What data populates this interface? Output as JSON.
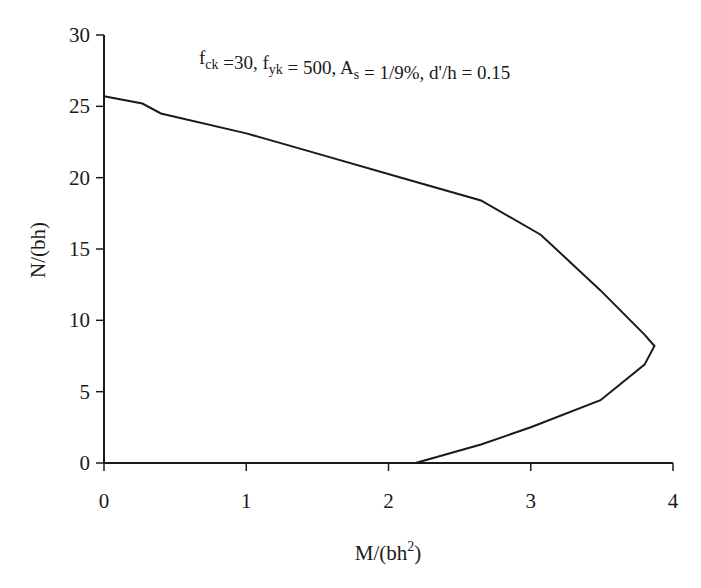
{
  "chart_data": {
    "type": "line",
    "title": "",
    "annotation": {
      "parts": [
        {
          "text": "f",
          "sub": "ck"
        },
        {
          "text": " =30, f",
          "sub": "yk"
        },
        {
          "text": " = 500, A",
          "sub": "s"
        },
        {
          "text": " = 1/9%, d'/h = 0.15",
          "sub": ""
        }
      ],
      "plain": "fck =30, fyk = 500, As = 1/9%, d'/h = 0.15"
    },
    "xlabel": "M/(bh",
    "xlabel_sup": "2",
    "xlabel_close": ")",
    "ylabel": "N/(bh)",
    "xlim": [
      0,
      4
    ],
    "ylim": [
      0,
      30
    ],
    "xticks": [
      0,
      1,
      2,
      3,
      4
    ],
    "yticks": [
      0,
      5,
      10,
      15,
      20,
      25,
      30
    ],
    "grid": false,
    "legend": null,
    "series": [
      {
        "name": "M-N interaction curve",
        "color": "#1a1a1a",
        "x": [
          0.0,
          0.27,
          0.4,
          1.0,
          1.39,
          2.09,
          2.65,
          3.07,
          3.49,
          3.8,
          3.87,
          3.8,
          3.49,
          3.0,
          2.65,
          2.19
        ],
        "y": [
          25.7,
          25.2,
          24.5,
          23.1,
          22.0,
          20.0,
          18.4,
          16.0,
          12.1,
          9.0,
          8.2,
          6.9,
          4.4,
          2.5,
          1.3,
          0.0
        ]
      }
    ]
  }
}
